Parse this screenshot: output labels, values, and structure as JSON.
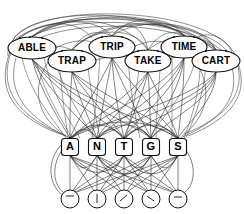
{
  "diagram": {
    "background_color": "#ffffff",
    "line_color": "#2b2b2b",
    "node_fill": "#ffffff",
    "node_stroke": "#111111",
    "layers": [
      {
        "name": "word-layer",
        "shape": "ellipse",
        "nodes": [
          {
            "id": "w1",
            "label": "ABLE",
            "cx": 32,
            "cy": 48,
            "rx": 24,
            "ry": 11
          },
          {
            "id": "w2",
            "label": "TRAP",
            "cx": 72,
            "cy": 61,
            "rx": 24,
            "ry": 11
          },
          {
            "id": "w3",
            "label": "TRIP",
            "cx": 112,
            "cy": 47,
            "rx": 23,
            "ry": 11
          },
          {
            "id": "w4",
            "label": "TAKE",
            "cx": 148,
            "cy": 61,
            "rx": 23,
            "ry": 11
          },
          {
            "id": "w5",
            "label": "TIME",
            "cx": 184,
            "cy": 47,
            "rx": 23,
            "ry": 11
          },
          {
            "id": "w6",
            "label": "CART",
            "cx": 216,
            "cy": 61,
            "rx": 24,
            "ry": 11
          }
        ]
      },
      {
        "name": "letter-layer",
        "shape": "rounded-rect",
        "nodes": [
          {
            "id": "l1",
            "label": "A",
            "cx": 70,
            "cy": 147,
            "w": 17,
            "h": 17
          },
          {
            "id": "l2",
            "label": "N",
            "cx": 97,
            "cy": 147,
            "w": 17,
            "h": 17
          },
          {
            "id": "l3",
            "label": "T",
            "cx": 124,
            "cy": 147,
            "w": 17,
            "h": 17
          },
          {
            "id": "l4",
            "label": "G",
            "cx": 151,
            "cy": 147,
            "w": 17,
            "h": 17
          },
          {
            "id": "l5",
            "label": "S",
            "cx": 178,
            "cy": 147,
            "w": 17,
            "h": 17
          }
        ]
      },
      {
        "name": "terminal-layer",
        "shape": "circle",
        "nodes": [
          {
            "id": "t1",
            "label": "",
            "cx": 70,
            "cy": 199,
            "r": 9,
            "mark": "dash"
          },
          {
            "id": "t2",
            "label": "",
            "cx": 97,
            "cy": 199,
            "r": 9,
            "mark": "bar"
          },
          {
            "id": "t3",
            "label": "",
            "cx": 124,
            "cy": 199,
            "r": 9,
            "mark": "slash"
          },
          {
            "id": "t4",
            "label": "",
            "cx": 151,
            "cy": 199,
            "r": 9,
            "mark": "slash"
          },
          {
            "id": "t5",
            "label": "",
            "cx": 178,
            "cy": 199,
            "r": 9,
            "mark": "dash"
          }
        ]
      }
    ],
    "edge_counts": {
      "word_to_word": 28,
      "word_to_letter": 44,
      "letter_to_letter": 18,
      "letter_to_terminal": 25
    }
  }
}
